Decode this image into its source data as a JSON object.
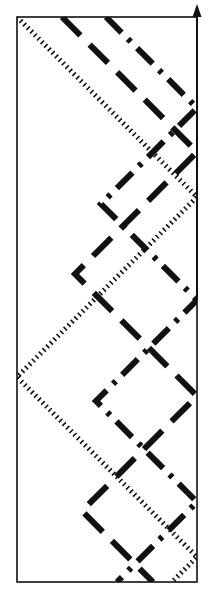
{
  "figure": {
    "background_color": "#ffffff",
    "ink_color": "#111111",
    "width": 213,
    "height": 604
  },
  "frame": {
    "name": "rectangular-boundary",
    "left": 17,
    "top": 17,
    "right": 197,
    "bottom": 582,
    "stroke_width": 1.6,
    "color": "#111111"
  },
  "axis": {
    "name": "vertical-axis-arrow",
    "orientation": "up",
    "x": 197,
    "tip_y": 4,
    "base_y": 300,
    "head_width": 9,
    "head_height": 13,
    "stroke_width": 2,
    "color": "#111111"
  },
  "rays": [
    {
      "id": "ray-dotted",
      "style": "dotted",
      "label": "dotted ray",
      "color": "#111111",
      "stroke_width": 5,
      "dash_pattern": "1.6 3.4",
      "start": [
        17,
        17
      ],
      "points": [
        [
          17,
          17
        ],
        [
          197,
          197
        ],
        [
          17,
          377
        ],
        [
          197,
          557
        ],
        [
          172,
          582
        ]
      ]
    },
    {
      "id": "ray-dashed",
      "style": "dashed",
      "label": "dashed ray",
      "color": "#111111",
      "stroke_width": 6,
      "dash_pattern": "26 13",
      "start": [
        62,
        17
      ],
      "points": [
        [
          62,
          17
        ],
        [
          197,
          152
        ],
        [
          75,
          274
        ],
        [
          197,
          396
        ],
        [
          82,
          511
        ],
        [
          153,
          582
        ]
      ]
    },
    {
      "id": "ray-dashdot",
      "style": "dash-dot",
      "label": "dash-dot ray",
      "color": "#111111",
      "stroke_width": 6,
      "dash_pattern": "22 9 4 9",
      "start": [
        106,
        17
      ],
      "points": [
        [
          106,
          17
        ],
        [
          197,
          108
        ],
        [
          101,
          204
        ],
        [
          197,
          300
        ],
        [
          96,
          401
        ],
        [
          197,
          502
        ],
        [
          117,
          582
        ]
      ]
    }
  ],
  "legend": {
    "visible": false,
    "entries": [
      {
        "name": "dotted",
        "label": "dotted ray"
      },
      {
        "name": "dashed",
        "label": "dashed ray"
      },
      {
        "name": "dash-dot",
        "label": "dash-dot ray"
      }
    ]
  }
}
